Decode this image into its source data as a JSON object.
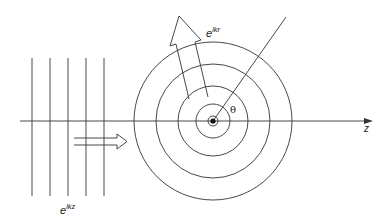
{
  "diagram": {
    "labels": {
      "plane_wave": {
        "base": "e",
        "exp": "ikz"
      },
      "spherical_wave": {
        "base": "e",
        "exp": "ikr"
      },
      "angle": "θ",
      "axis": "z"
    },
    "colors": {
      "stroke": "#333333",
      "background": "#ffffff"
    },
    "geometry": {
      "center": [
        213,
        121
      ],
      "circle_radii": [
        17,
        35,
        57,
        79
      ],
      "plane_wave_x": [
        32,
        50,
        68,
        86,
        104
      ],
      "axis_y": 121
    }
  }
}
